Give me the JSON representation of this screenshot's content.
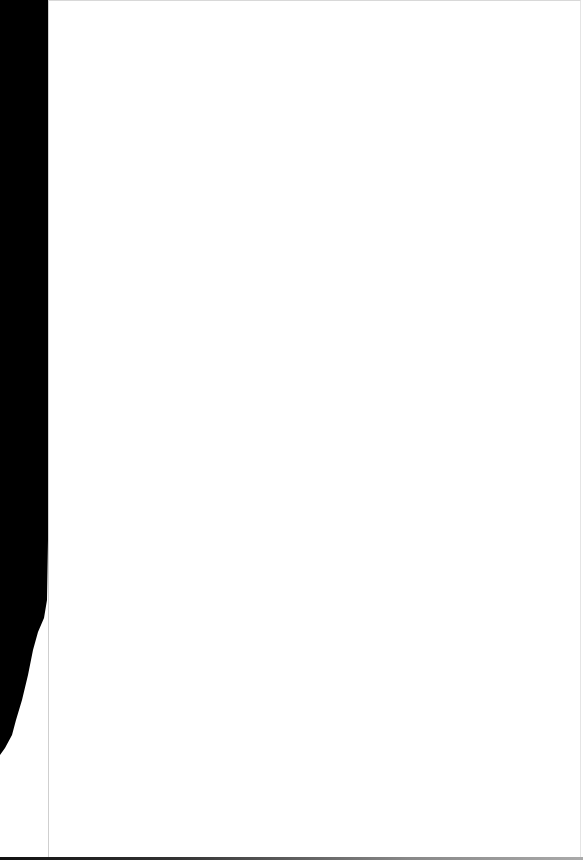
{
  "document": {
    "page_content": "",
    "colors": {
      "page_background": "#ffffff",
      "scan_edge": "#000000"
    }
  }
}
